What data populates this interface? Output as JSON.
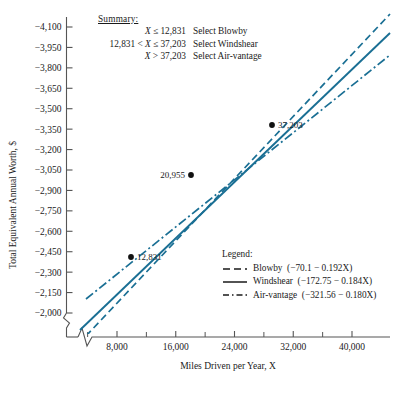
{
  "chart_data": {
    "type": "line",
    "title": "",
    "xlabel": "Miles Driven per Year, X",
    "ylabel": "Total Equivalent Annual Worth, $",
    "xlim": [
      0,
      42000
    ],
    "ylim": [
      -2000,
      -4175
    ],
    "xticks": [
      8000,
      16000,
      24000,
      32000,
      40000
    ],
    "xtick_labels": [
      "8,000",
      "16,000",
      "24,000",
      "32,000",
      "40,000"
    ],
    "xminor_ticks": [
      4000,
      12000,
      20000,
      28000,
      36000
    ],
    "yticks": [
      -2000,
      -2150,
      -2300,
      -2450,
      -2600,
      -2750,
      -2900,
      -3050,
      -3200,
      -3350,
      -3500,
      -3650,
      -3800,
      -3950,
      -4100
    ],
    "ytick_labels": [
      "−2,000",
      "−2,150",
      "−2,300",
      "−2,450",
      "−2,600",
      "−2,750",
      "−2,900",
      "−3,050",
      "−3,200",
      "−3,350",
      "−3,500",
      "−3,650",
      "−3,800",
      "−3,950",
      "−4,100"
    ],
    "grid": false,
    "axis_break_x": true,
    "axis_break_y": true,
    "line_color": "#1a6f94",
    "legend_position": "inside-lower-right",
    "series": [
      {
        "name": "Blowby",
        "equation": "(−70.1 − 0.192X)",
        "intercept": -70.1,
        "slope": -0.192,
        "style": "dashed"
      },
      {
        "name": "Windshear",
        "equation": "(−172.75 − 0.184X)",
        "intercept": -172.75,
        "slope": -0.184,
        "style": "solid"
      },
      {
        "name": "Air-vantage",
        "equation": "(−321.56 − 0.180X)",
        "intercept": -321.56,
        "slope": -0.18,
        "style": "dashdot"
      }
    ],
    "annotations": [
      {
        "label": "12,831",
        "x": 12831,
        "y": -2533.6,
        "label_side": "right"
      },
      {
        "label": "20,955",
        "x": 20955,
        "y": -4028.4,
        "label_side": "left"
      },
      {
        "label": "37,203",
        "x": 37203,
        "y": -7018.1,
        "label_side": "right"
      }
    ],
    "marker_points": [
      {
        "label": "12,831",
        "px": 131,
        "py": 257
      },
      {
        "label": "20,955",
        "px": 191,
        "py": 175
      },
      {
        "label": "37,203",
        "px": 272,
        "py": 125
      }
    ]
  },
  "summary": {
    "title": "Summary:",
    "rows": [
      {
        "condition_pre": "",
        "condition_var": "X",
        "condition_post": " ≤ 12,831",
        "action": "Select Blowby"
      },
      {
        "condition_pre": "12,831 < ",
        "condition_var": "X",
        "condition_post": " ≤ 37,203",
        "action": "Select Windshear"
      },
      {
        "condition_pre": "",
        "condition_var": "X",
        "condition_post": " > 37,203",
        "action": "Select Air-vantage"
      }
    ]
  },
  "legend": {
    "title": "Legend:",
    "entries": [
      {
        "name": "Blowby",
        "equation": "(−70.1 − 0.192X)",
        "style": "dashed"
      },
      {
        "name": "Windshear",
        "equation": "(−172.75 − 0.184X)",
        "style": "solid"
      },
      {
        "name": "Air-vantage",
        "equation": "(−321.56 − 0.180X)",
        "style": "dashdot"
      }
    ]
  },
  "axes": {
    "x_title": "Miles Driven per Year, X",
    "y_title": "Total Equivalent Annual Worth, $"
  }
}
